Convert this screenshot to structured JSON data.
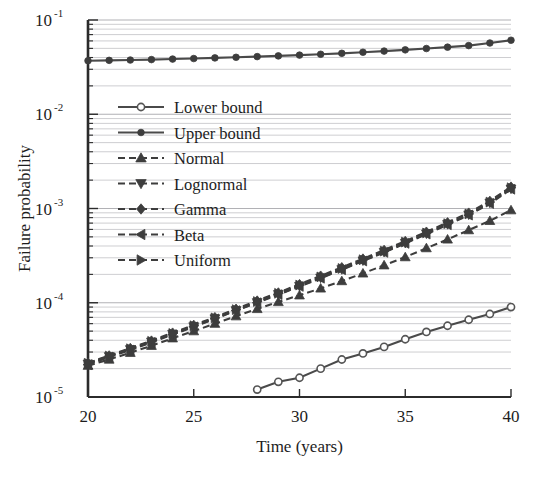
{
  "chart_data": {
    "type": "line",
    "title": "",
    "xlabel": "Time (years)",
    "ylabel": "Failure probability",
    "xlim": [
      20,
      40
    ],
    "ylim": [
      1e-05,
      0.1
    ],
    "yscale": "log",
    "grid": true,
    "legend_position": "upper-left-inside",
    "x_ticks": [
      20,
      25,
      30,
      35,
      40
    ],
    "x_tick_labels": [
      "20",
      "25",
      "30",
      "35",
      "40"
    ],
    "y_ticks": [
      1e-05,
      0.0001,
      0.001,
      0.01,
      0.1
    ],
    "y_tick_labels": [
      "10-5",
      "10-4",
      "10-3",
      "10-2",
      "10-1"
    ],
    "y_tick_bases": [
      "10",
      "10",
      "10",
      "10",
      "10"
    ],
    "y_tick_exponents": [
      "-5",
      "-4",
      "-3",
      "-2",
      "-1"
    ],
    "x": [
      20,
      21,
      22,
      23,
      24,
      25,
      26,
      27,
      28,
      29,
      30,
      31,
      32,
      33,
      34,
      35,
      36,
      37,
      38,
      39,
      40
    ],
    "series": [
      {
        "name": "Lower bound",
        "marker": "circle-open",
        "linestyle": "solid",
        "color": "#555555",
        "x": [
          28,
          29,
          30,
          31,
          32,
          33,
          34,
          35,
          36,
          37,
          38,
          39,
          40
        ],
        "values": [
          1.2e-05,
          1.45e-05,
          1.6e-05,
          2e-05,
          2.5e-05,
          2.9e-05,
          3.4e-05,
          4.1e-05,
          4.9e-05,
          5.7e-05,
          6.6e-05,
          7.6e-05,
          9e-05
        ]
      },
      {
        "name": "Upper bound",
        "marker": "circle-filled",
        "linestyle": "solid",
        "color": "#3d3d3d",
        "values": [
          0.037,
          0.0373,
          0.0376,
          0.038,
          0.0385,
          0.039,
          0.0396,
          0.0402,
          0.0409,
          0.0416,
          0.0424,
          0.0433,
          0.0443,
          0.0455,
          0.0468,
          0.0482,
          0.0498,
          0.0515,
          0.0535,
          0.057,
          0.061
        ]
      },
      {
        "name": "Normal",
        "marker": "triangle-up",
        "linestyle": "dashed",
        "color": "#3d3d3d",
        "values": [
          2.15e-05,
          2.5e-05,
          2.95e-05,
          3.5e-05,
          4.2e-05,
          5e-05,
          6e-05,
          7.2e-05,
          8.6e-05,
          0.000102,
          0.00012,
          0.000142,
          0.00017,
          0.000205,
          0.00025,
          0.000305,
          0.00038,
          0.00047,
          0.00059,
          0.00074,
          0.00096
        ]
      },
      {
        "name": "Lognormal",
        "marker": "triangle-down",
        "linestyle": "dashed",
        "color": "#3d3d3d",
        "values": [
          2.25e-05,
          2.7e-05,
          3.2e-05,
          3.85e-05,
          4.65e-05,
          5.6e-05,
          6.8e-05,
          8.3e-05,
          0.000101,
          0.000123,
          0.00015,
          0.000184,
          0.000226,
          0.00028,
          0.000345,
          0.00043,
          0.00054,
          0.00068,
          0.00086,
          0.00115,
          0.00162
        ]
      },
      {
        "name": "Gamma",
        "marker": "diamond",
        "linestyle": "dashed",
        "color": "#3d3d3d",
        "values": [
          2.3e-05,
          2.75e-05,
          3.3e-05,
          3.95e-05,
          4.8e-05,
          5.8e-05,
          7e-05,
          8.6e-05,
          0.000105,
          0.000128,
          0.000157,
          0.000193,
          0.000237,
          0.000293,
          0.000362,
          0.00045,
          0.000565,
          0.00071,
          0.0009,
          0.0012,
          0.0017
        ]
      },
      {
        "name": "Beta",
        "marker": "triangle-left",
        "linestyle": "dashed",
        "color": "#3d3d3d",
        "values": [
          2.2e-05,
          2.65e-05,
          3.15e-05,
          3.8e-05,
          4.6e-05,
          5.55e-05,
          6.75e-05,
          8.25e-05,
          0.0001,
          0.000122,
          0.000149,
          0.000182,
          0.000224,
          0.000277,
          0.000342,
          0.000426,
          0.000535,
          0.000672,
          0.00085,
          0.00113,
          0.0016
        ]
      },
      {
        "name": "Uniform",
        "marker": "triangle-right",
        "linestyle": "dashed",
        "color": "#3d3d3d",
        "values": [
          2.28e-05,
          2.72e-05,
          3.25e-05,
          3.9e-05,
          4.72e-05,
          5.7e-05,
          6.9e-05,
          8.45e-05,
          0.000103,
          0.000126,
          0.000154,
          0.000188,
          0.000231,
          0.000286,
          0.000353,
          0.00044,
          0.00055,
          0.00069,
          0.000875,
          0.00117,
          0.00166
        ]
      }
    ]
  },
  "legend": {
    "items": [
      {
        "label": "Lower bound"
      },
      {
        "label": "Upper bound"
      },
      {
        "label": "Normal"
      },
      {
        "label": "Lognormal"
      },
      {
        "label": "Gamma"
      },
      {
        "label": "Beta"
      },
      {
        "label": "Uniform"
      }
    ]
  }
}
